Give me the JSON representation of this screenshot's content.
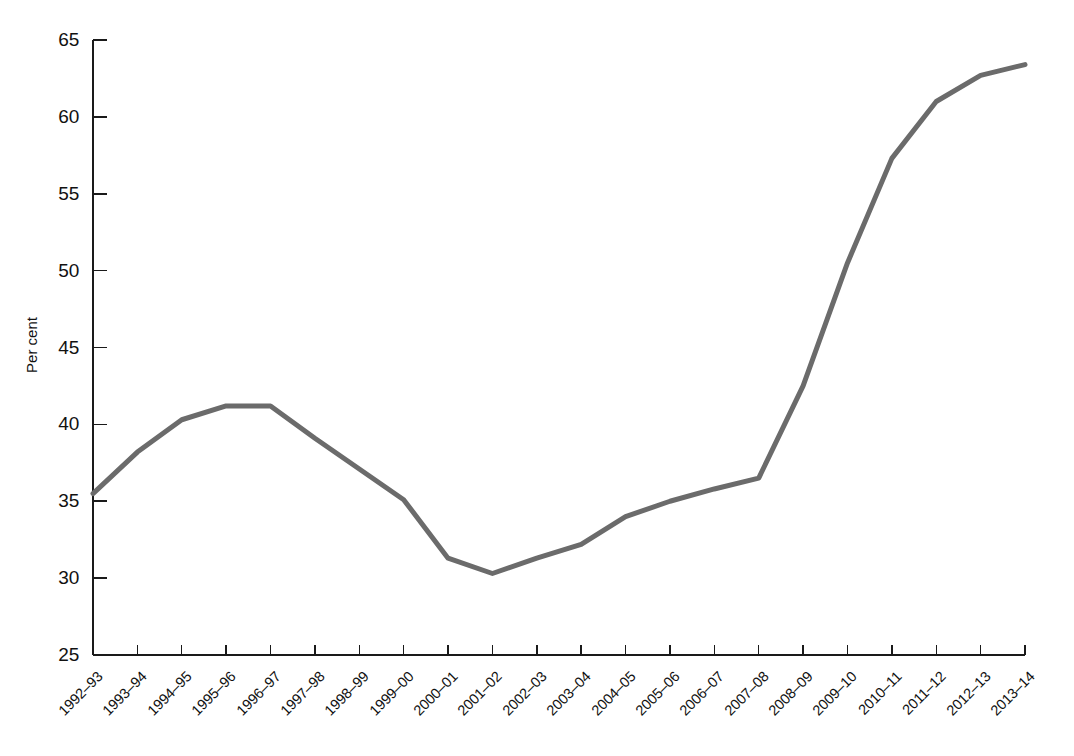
{
  "chart_data": {
    "type": "line",
    "title": "",
    "subtitle": "",
    "xlabel": "",
    "ylabel": "Per cent",
    "ylim": [
      25,
      65
    ],
    "ytick_values": [
      25,
      30,
      35,
      40,
      45,
      50,
      55,
      60,
      65
    ],
    "ytick_labels": [
      "25",
      "30",
      "35",
      "40",
      "45",
      "50",
      "55",
      "60",
      "65"
    ],
    "grid": false,
    "legend": "none",
    "line_color": "#6b6b6b",
    "line_width": 5,
    "axis_color": "#1a1a1a",
    "categories": [
      "1992–93",
      "1993–94",
      "1994–95",
      "1995–96",
      "1996–97",
      "1997–98",
      "1998–99",
      "1999–00",
      "2000–01",
      "2001–02",
      "2002–03",
      "2003–04",
      "2004–05",
      "2005–06",
      "2006–07",
      "2007–08",
      "2008–09",
      "2009–10",
      "2010–11",
      "2011–12",
      "2012–13",
      "2013–14"
    ],
    "values": [
      35.5,
      38.2,
      40.3,
      41.2,
      41.2,
      39.1,
      37.1,
      35.1,
      31.3,
      30.3,
      31.3,
      32.2,
      34.0,
      35.0,
      35.8,
      36.5,
      42.5,
      50.5,
      57.3,
      61.0,
      62.7,
      63.4
    ],
    "series": [
      {
        "name": "Per cent",
        "values": [
          35.5,
          38.2,
          40.3,
          41.2,
          41.2,
          39.1,
          37.1,
          35.1,
          31.3,
          30.3,
          31.3,
          32.2,
          34.0,
          35.0,
          35.8,
          36.5,
          42.5,
          50.5,
          57.3,
          61.0,
          62.7,
          63.4
        ]
      }
    ]
  },
  "layout": {
    "plot_left": 93,
    "plot_right": 1025,
    "plot_top": 40,
    "plot_bottom": 655
  }
}
